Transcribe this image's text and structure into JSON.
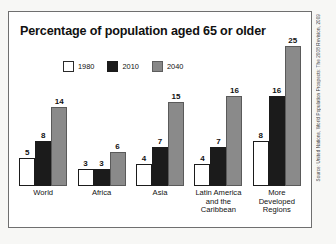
{
  "chart": {
    "title": "Percentage of population aged 65 or older",
    "source_credit": "Source: United Nations, World Population Prospects: The 2008 Revision, 2009"
  },
  "legend": {
    "items": [
      {
        "label": "1980",
        "swatch": "white"
      },
      {
        "label": "2010",
        "swatch": "black"
      },
      {
        "label": "2040",
        "swatch": "gray"
      }
    ]
  },
  "chart_data": {
    "type": "bar",
    "title": "Percentage of population aged 65 or older",
    "xlabel": "",
    "ylabel": "",
    "ylim": [
      0,
      26
    ],
    "grid": false,
    "legend_position": "top",
    "categories": [
      "World",
      "Africa",
      "Asia",
      "Latin America and the Caribbean",
      "More Developed Regions"
    ],
    "category_lines": [
      [
        "World"
      ],
      [
        "Africa"
      ],
      [
        "Asia"
      ],
      [
        "Latin America",
        "and the",
        "Caribbean"
      ],
      [
        "More",
        "Developed",
        "Regions"
      ]
    ],
    "series": [
      {
        "name": "1980",
        "color": "#ffffff",
        "values": [
          5,
          3,
          4,
          4,
          8
        ]
      },
      {
        "name": "2010",
        "color": "#1b1b1b",
        "values": [
          8,
          3,
          7,
          7,
          16
        ]
      },
      {
        "name": "2040",
        "color": "#8a8a8a",
        "values": [
          14,
          6,
          15,
          16,
          25
        ]
      }
    ]
  }
}
